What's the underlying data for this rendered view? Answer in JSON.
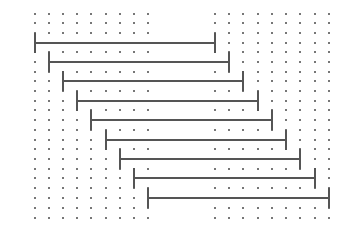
{
  "diagram": {
    "type": "staggered-interval-bars-on-dot-grid",
    "grid": {
      "dot_color": "#777777",
      "columns_x": [
        35,
        49,
        63,
        77,
        91,
        106,
        120,
        134,
        148,
        215,
        229,
        243,
        258,
        272,
        286,
        300,
        315,
        329
      ],
      "rows_y": [
        14,
        23,
        33,
        43,
        52,
        62,
        72,
        81,
        91,
        101,
        110,
        120,
        130,
        140,
        149,
        159,
        169,
        178,
        188,
        198,
        208,
        218
      ]
    },
    "bar_color": "#555555",
    "tick_half_height": 10,
    "bars": [
      {
        "x1": 35,
        "x2": 215,
        "y": 43
      },
      {
        "x1": 49,
        "x2": 229,
        "y": 62
      },
      {
        "x1": 63,
        "x2": 243,
        "y": 81
      },
      {
        "x1": 77,
        "x2": 258,
        "y": 101
      },
      {
        "x1": 91,
        "x2": 272,
        "y": 120
      },
      {
        "x1": 106,
        "x2": 286,
        "y": 140
      },
      {
        "x1": 120,
        "x2": 300,
        "y": 159
      },
      {
        "x1": 134,
        "x2": 315,
        "y": 178
      },
      {
        "x1": 148,
        "x2": 329,
        "y": 198
      }
    ]
  }
}
